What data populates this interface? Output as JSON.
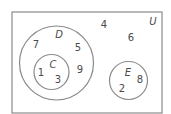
{
  "diagram": {
    "type": "venn",
    "universal_set": {
      "label": "U",
      "x": 12,
      "y": 12,
      "width": 150,
      "height": 101
    },
    "sets": [
      {
        "name": "D",
        "cx": 56.5,
        "cy": 63,
        "r": 37,
        "label_x": 59,
        "label_y": 38
      },
      {
        "name": "C",
        "cx": 51.5,
        "cy": 72,
        "r": 17.5,
        "label_x": 53,
        "label_y": 68,
        "subset_of": "D"
      },
      {
        "name": "E",
        "cx": 128.5,
        "cy": 80.5,
        "r": 19,
        "label_x": 128,
        "label_y": 76
      }
    ],
    "elements": [
      {
        "value": "7",
        "x": 36,
        "y": 48,
        "region": "D only"
      },
      {
        "value": "5",
        "x": 78,
        "y": 51,
        "region": "D only"
      },
      {
        "value": "9",
        "x": 80,
        "y": 73,
        "region": "D only"
      },
      {
        "value": "1",
        "x": 41,
        "y": 76,
        "region": "C"
      },
      {
        "value": "3",
        "x": 58,
        "y": 83,
        "region": "C"
      },
      {
        "value": "4",
        "x": 104,
        "y": 28,
        "region": "U only"
      },
      {
        "value": "6",
        "x": 131,
        "y": 41,
        "region": "U only"
      },
      {
        "value": "8",
        "x": 140,
        "y": 83,
        "region": "E"
      },
      {
        "value": "2",
        "x": 122,
        "y": 92,
        "region": "E"
      }
    ],
    "universal_label": {
      "value": "U",
      "x": 153,
      "y": 25
    }
  }
}
